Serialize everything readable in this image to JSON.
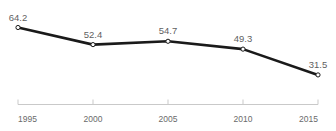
{
  "chart_data": {
    "type": "line",
    "title": "",
    "subtitle": "",
    "xlabel": "",
    "ylabel": "",
    "categories": [
      "1995",
      "2000",
      "2005",
      "2010",
      "2015"
    ],
    "x": [
      1995,
      2000,
      2005,
      2010,
      2015
    ],
    "values": [
      64.2,
      52.4,
      54.7,
      49.3,
      31.5
    ],
    "series": [
      {
        "name": "",
        "values": [
          64.2,
          52.4,
          54.7,
          49.3,
          31.5
        ]
      }
    ],
    "data_labels": [
      "64.2",
      "52.4",
      "54.7",
      "49.3",
      "31.5"
    ],
    "tick_labels": [
      "1995",
      "2000",
      "2005",
      "2010",
      "2015"
    ],
    "xlim": [
      1995,
      2015
    ],
    "ylim": [
      28.0,
      68.0
    ],
    "grid": false,
    "legend": null,
    "legend_position": "none",
    "line_color": "#1a1a1a",
    "marker_face_color": "#ffffff",
    "marker_edge_color": "#1a1a1a",
    "label_color": "#5f5f5f",
    "axis_color": "#c9c9c9",
    "tick_label_color": "#6a6a6a",
    "background_color": "#ffffff",
    "clipped_title_note": "title row is cut off at the top edge of the screenshot and is unreadable"
  }
}
